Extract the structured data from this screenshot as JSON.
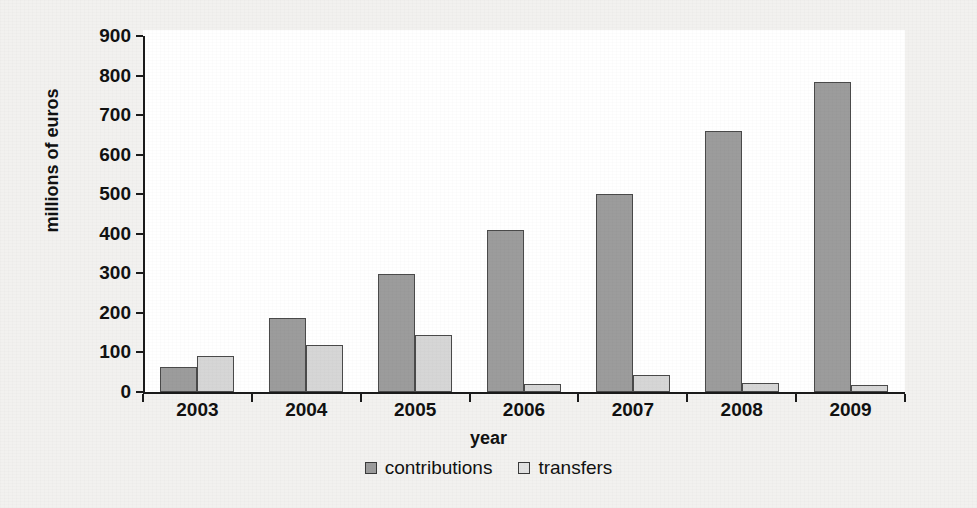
{
  "chart_data": {
    "type": "bar",
    "title": "",
    "xlabel": "year",
    "ylabel": "millions of euros",
    "categories": [
      "2003",
      "2004",
      "2005",
      "2006",
      "2007",
      "2008",
      "2009"
    ],
    "series": [
      {
        "name": "contributions",
        "color": "#9c9c9c",
        "values": [
          62,
          188,
          298,
          410,
          500,
          660,
          785
        ]
      },
      {
        "name": "transfers",
        "color": "#d6d6d6",
        "values": [
          90,
          118,
          145,
          20,
          42,
          23,
          19
        ]
      }
    ],
    "ylim": [
      0,
      900
    ],
    "y_ticks": [
      "0",
      "100",
      "200",
      "300",
      "400",
      "500",
      "600",
      "700",
      "800",
      "900"
    ],
    "grid": false,
    "legend_position": "bottom"
  },
  "legend": {
    "entries": [
      {
        "label": "contributions"
      },
      {
        "label": "transfers"
      }
    ]
  }
}
